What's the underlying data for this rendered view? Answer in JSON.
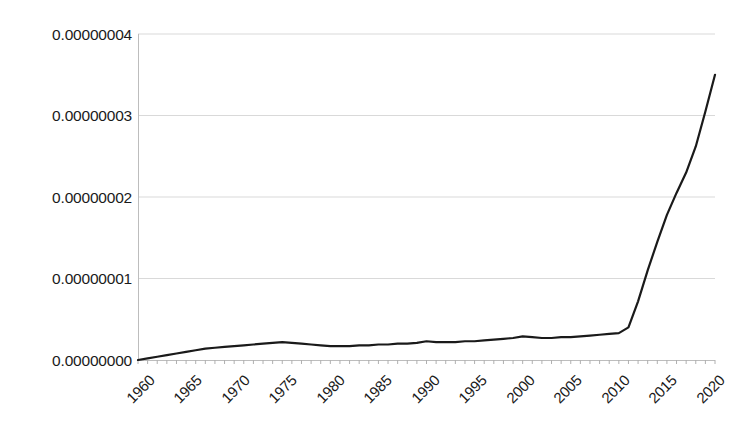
{
  "chart_data": {
    "type": "line",
    "title": "",
    "xlabel": "",
    "ylabel": "",
    "xlim": [
      1960,
      2020
    ],
    "ylim": [
      0,
      4e-08
    ],
    "grid": true,
    "legend": false,
    "ytick_labels": [
      "0.00000004",
      "0.00000003",
      "0.00000002",
      "0.00000001",
      "0.00000000"
    ],
    "ytick_values": [
      4e-08,
      3e-08,
      2e-08,
      1e-08,
      0
    ],
    "xtick_labels": [
      "1960",
      "1965",
      "1970",
      "1975",
      "1980",
      "1985",
      "1990",
      "1995",
      "2000",
      "2005",
      "2010",
      "2015",
      "2020"
    ],
    "xtick_values": [
      1960,
      1965,
      1970,
      1975,
      1980,
      1985,
      1990,
      1995,
      2000,
      2005,
      2010,
      2015,
      2020
    ],
    "series": [
      {
        "name": "value",
        "color": "#1a1a1a",
        "line_width": 2.2,
        "x": [
          1960,
          1961,
          1962,
          1963,
          1964,
          1965,
          1966,
          1967,
          1968,
          1969,
          1970,
          1971,
          1972,
          1973,
          1974,
          1975,
          1976,
          1977,
          1978,
          1979,
          1980,
          1981,
          1982,
          1983,
          1984,
          1985,
          1986,
          1987,
          1988,
          1989,
          1990,
          1991,
          1992,
          1993,
          1994,
          1995,
          1996,
          1997,
          1998,
          1999,
          2000,
          2001,
          2002,
          2003,
          2004,
          2005,
          2006,
          2007,
          2008,
          2009,
          2010,
          2011,
          2012,
          2013,
          2014,
          2015,
          2016,
          2017,
          2018,
          2019,
          2020
        ],
        "y": [
          0.0,
          2e-10,
          4e-10,
          6e-10,
          8e-10,
          1e-09,
          1.2e-09,
          1.4e-09,
          1.5e-09,
          1.6e-09,
          1.7e-09,
          1.8e-09,
          1.9e-09,
          2e-09,
          2.1e-09,
          2.2e-09,
          2.1e-09,
          2e-09,
          1.9e-09,
          1.8e-09,
          1.7e-09,
          1.7e-09,
          1.7e-09,
          1.8e-09,
          1.8e-09,
          1.9e-09,
          1.9e-09,
          2e-09,
          2e-09,
          2.1e-09,
          2.3e-09,
          2.2e-09,
          2.2e-09,
          2.2e-09,
          2.3e-09,
          2.3e-09,
          2.4e-09,
          2.5e-09,
          2.6e-09,
          2.7e-09,
          2.9e-09,
          2.8e-09,
          2.7e-09,
          2.7e-09,
          2.8e-09,
          2.8e-09,
          2.9e-09,
          3e-09,
          3.1e-09,
          3.2e-09,
          3.3e-09,
          4e-09,
          7.2e-09,
          1.1e-08,
          1.45e-08,
          1.78e-08,
          2.05e-08,
          2.3e-08,
          2.62e-08,
          3.05e-08,
          3.5e-08
        ]
      }
    ]
  },
  "axes": {
    "axis_color": "#b0b0b0",
    "grid_color": "#d9d9d9",
    "tick_color": "#b0b0b0"
  }
}
